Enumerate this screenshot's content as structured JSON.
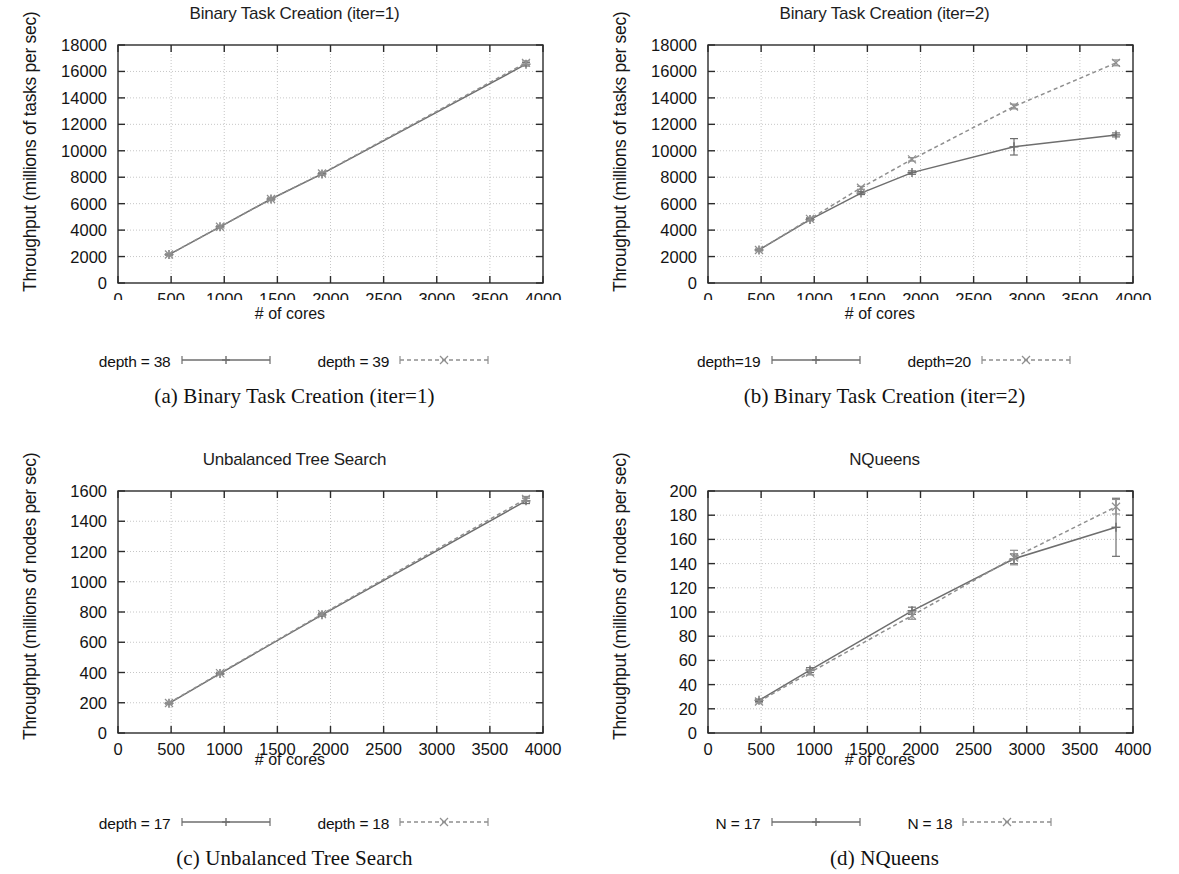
{
  "figure": {
    "panels": [
      {
        "key": "a",
        "caption": "(a) Binary Task Creation (iter=1)",
        "title": "Binary Task Creation (iter=1)",
        "ylabel": "Throughput (millions of tasks per sec)",
        "xlabel": "# of cores",
        "legend": [
          {
            "label": "depth = 38",
            "style": "solid"
          },
          {
            "label": "depth = 39",
            "style": "dashed"
          }
        ],
        "xticks": [
          "0",
          "500",
          "1000",
          "1500",
          "2000",
          "2500",
          "3000",
          "3500",
          "4000"
        ],
        "yticks": [
          "0",
          "2000",
          "4000",
          "6000",
          "8000",
          "10000",
          "12000",
          "14000",
          "16000",
          "18000"
        ]
      },
      {
        "key": "b",
        "caption": "(b) Binary Task Creation (iter=2)",
        "title": "Binary Task Creation (iter=2)",
        "ylabel": "Throughput (millions of tasks per sec)",
        "xlabel": "# of cores",
        "legend": [
          {
            "label": "depth=19",
            "style": "solid"
          },
          {
            "label": "depth=20",
            "style": "dashed"
          }
        ],
        "xticks": [
          "0",
          "500",
          "1000",
          "1500",
          "2000",
          "2500",
          "3000",
          "3500",
          "4000"
        ],
        "yticks": [
          "0",
          "2000",
          "4000",
          "6000",
          "8000",
          "10000",
          "12000",
          "14000",
          "16000",
          "18000"
        ]
      },
      {
        "key": "c",
        "caption": "(c) Unbalanced Tree Search",
        "title": "Unbalanced Tree Search",
        "ylabel": "Throughput (millions of nodes per sec)",
        "xlabel": "# of cores",
        "legend": [
          {
            "label": "depth = 17",
            "style": "solid"
          },
          {
            "label": "depth = 18",
            "style": "dashed"
          }
        ],
        "xticks": [
          "0",
          "500",
          "1000",
          "1500",
          "2000",
          "2500",
          "3000",
          "3500",
          "4000"
        ],
        "yticks": [
          "0",
          "200",
          "400",
          "600",
          "800",
          "1000",
          "1200",
          "1400",
          "1600"
        ]
      },
      {
        "key": "d",
        "caption": "(d) NQueens",
        "title": "NQueens",
        "ylabel": "Throughput (millions of nodes per sec)",
        "xlabel": "# of cores",
        "legend": [
          {
            "label": "N = 17",
            "style": "solid"
          },
          {
            "label": "N = 18",
            "style": "dashed"
          }
        ],
        "xticks": [
          "0",
          "500",
          "1000",
          "1500",
          "2000",
          "2500",
          "3000",
          "3500",
          "4000"
        ],
        "yticks": [
          "0",
          "20",
          "40",
          "60",
          "80",
          "100",
          "120",
          "140",
          "160",
          "180",
          "200"
        ]
      }
    ]
  },
  "chart_data": [
    {
      "panel": "a",
      "type": "line",
      "title": "Binary Task Creation (iter=1)",
      "xlabel": "# of cores",
      "ylabel": "Throughput (millions of tasks per sec)",
      "xlim": [
        0,
        4000
      ],
      "ylim": [
        0,
        18000
      ],
      "xticks": [
        0,
        500,
        1000,
        1500,
        2000,
        2500,
        3000,
        3500,
        4000
      ],
      "yticks": [
        0,
        2000,
        4000,
        6000,
        8000,
        10000,
        12000,
        14000,
        16000,
        18000
      ],
      "grid": true,
      "legend_position": "below",
      "series": [
        {
          "name": "depth = 38",
          "style": "solid",
          "x": [
            480,
            960,
            1440,
            1920,
            3840
          ],
          "values": [
            2150,
            4250,
            6350,
            8250,
            16550
          ],
          "errors": [
            40,
            60,
            70,
            80,
            140
          ]
        },
        {
          "name": "depth = 39",
          "style": "dashed",
          "x": [
            480,
            960,
            1440,
            1920,
            3840
          ],
          "values": [
            2150,
            4250,
            6350,
            8280,
            16650
          ],
          "errors": [
            40,
            60,
            70,
            80,
            150
          ]
        }
      ]
    },
    {
      "panel": "b",
      "type": "line",
      "title": "Binary Task Creation (iter=2)",
      "xlabel": "# of cores",
      "ylabel": "Throughput (millions of tasks per sec)",
      "xlim": [
        0,
        4000
      ],
      "ylim": [
        0,
        18000
      ],
      "xticks": [
        0,
        500,
        1000,
        1500,
        2000,
        2500,
        3000,
        3500,
        4000
      ],
      "yticks": [
        0,
        2000,
        4000,
        6000,
        8000,
        10000,
        12000,
        14000,
        16000,
        18000
      ],
      "grid": true,
      "legend_position": "below",
      "series": [
        {
          "name": "depth=19",
          "style": "solid",
          "x": [
            480,
            960,
            1440,
            1920,
            2880,
            3840
          ],
          "values": [
            2500,
            4800,
            6800,
            8350,
            10300,
            11200
          ],
          "errors": [
            60,
            90,
            110,
            130,
            620,
            150
          ]
        },
        {
          "name": "depth=20",
          "style": "dashed",
          "x": [
            480,
            960,
            1440,
            1920,
            2880,
            3840
          ],
          "values": [
            2500,
            4850,
            7200,
            9350,
            13350,
            16650
          ],
          "errors": [
            60,
            90,
            110,
            130,
            180,
            220
          ]
        }
      ]
    },
    {
      "panel": "c",
      "type": "line",
      "title": "Unbalanced Tree Search",
      "xlabel": "# of cores",
      "ylabel": "Throughput (millions of nodes per sec)",
      "xlim": [
        0,
        4000
      ],
      "ylim": [
        0,
        1600
      ],
      "xticks": [
        0,
        500,
        1000,
        1500,
        2000,
        2500,
        3000,
        3500,
        4000
      ],
      "yticks": [
        0,
        200,
        400,
        600,
        800,
        1000,
        1200,
        1400,
        1600
      ],
      "grid": true,
      "legend_position": "below",
      "series": [
        {
          "name": "depth = 17",
          "style": "solid",
          "x": [
            480,
            960,
            1920,
            3840
          ],
          "values": [
            196,
            393,
            781,
            1535
          ],
          "errors": [
            4,
            6,
            8,
            18
          ]
        },
        {
          "name": "depth = 18",
          "style": "dashed",
          "x": [
            480,
            960,
            1920,
            3840
          ],
          "values": [
            198,
            396,
            786,
            1548
          ],
          "errors": [
            4,
            6,
            8,
            16
          ]
        }
      ]
    },
    {
      "panel": "d",
      "type": "line",
      "title": "NQueens",
      "xlabel": "# of cores",
      "ylabel": "Throughput (millions of nodes per sec)",
      "xlim": [
        0,
        4000
      ],
      "ylim": [
        0,
        200
      ],
      "xticks": [
        0,
        500,
        1000,
        1500,
        2000,
        2500,
        3000,
        3500,
        4000
      ],
      "yticks": [
        0,
        20,
        40,
        60,
        80,
        100,
        120,
        140,
        160,
        180,
        200
      ],
      "grid": true,
      "legend_position": "below",
      "series": [
        {
          "name": "N = 17",
          "style": "solid",
          "x": [
            480,
            960,
            1920,
            2880,
            3840
          ],
          "values": [
            27,
            52,
            101,
            144,
            170
          ],
          "errors": [
            1,
            2,
            3,
            4,
            24
          ]
        },
        {
          "name": "N = 18",
          "style": "dashed",
          "x": [
            480,
            960,
            1920,
            2880,
            3840
          ],
          "values": [
            26,
            50,
            97,
            145,
            187
          ],
          "errors": [
            1,
            2,
            3,
            6,
            6
          ]
        }
      ]
    }
  ],
  "colors": {
    "solid_line": "#6e6e6e",
    "dashed_line": "#8f8f8f",
    "axis": "#2b2b2b",
    "grid": "#b8b8b8",
    "text": "#141414"
  }
}
